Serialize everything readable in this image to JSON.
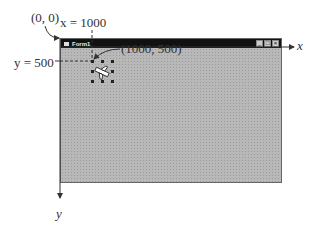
{
  "labels": {
    "origin": "(0, 0)",
    "x_eq": "x = 1000",
    "y_eq": "y = 500",
    "point": "(1000, 500)",
    "x_axis": "x",
    "y_axis": "y"
  },
  "window": {
    "title": "Form1",
    "controls": [
      "_",
      "□",
      "×"
    ]
  },
  "colors": {
    "form_bg": "#b8b8b8",
    "titlebar": "#111111",
    "line": "#333333"
  }
}
